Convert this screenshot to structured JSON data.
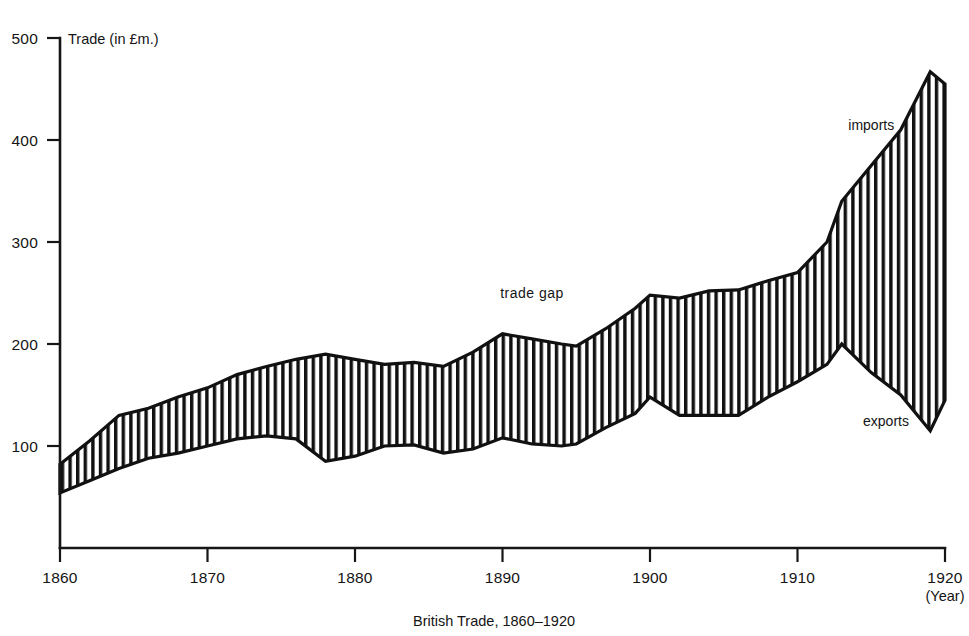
{
  "chart_data": {
    "type": "area",
    "caption": "British Trade, 1860–1920",
    "xlabel": "(Year)",
    "ylabel": "Trade (in £m.)",
    "xlim": [
      1860,
      1920
    ],
    "ylim": [
      0,
      500
    ],
    "grid": false,
    "legend_position": "inline-annotations",
    "y_ticks": [
      100,
      200,
      300,
      400,
      500
    ],
    "x_ticks": [
      1860,
      1870,
      1880,
      1890,
      1900,
      1910,
      1920
    ],
    "annotations": [
      {
        "text": "imports",
        "x": 1915,
        "y": 410
      },
      {
        "text": "exports",
        "x": 1916,
        "y": 120
      },
      {
        "text": "trade  gap",
        "x": 1892,
        "y": 245
      }
    ],
    "x": [
      1860,
      1862,
      1864,
      1866,
      1868,
      1870,
      1872,
      1874,
      1876,
      1878,
      1880,
      1882,
      1884,
      1886,
      1888,
      1890,
      1892,
      1894,
      1895,
      1897,
      1899,
      1900,
      1902,
      1904,
      1906,
      1908,
      1910,
      1912,
      1913,
      1915,
      1917,
      1919,
      1920
    ],
    "series": [
      {
        "name": "imports",
        "values": [
          82,
          105,
          130,
          137,
          148,
          157,
          170,
          178,
          185,
          190,
          185,
          180,
          182,
          178,
          192,
          210,
          205,
          200,
          198,
          215,
          235,
          248,
          245,
          252,
          253,
          262,
          270,
          300,
          340,
          375,
          410,
          467,
          455
        ]
      },
      {
        "name": "exports",
        "values": [
          54,
          66,
          78,
          88,
          93,
          100,
          107,
          110,
          107,
          85,
          90,
          100,
          101,
          93,
          97,
          108,
          102,
          100,
          102,
          118,
          132,
          148,
          130,
          130,
          130,
          148,
          163,
          180,
          200,
          172,
          150,
          115,
          145
        ]
      }
    ]
  }
}
